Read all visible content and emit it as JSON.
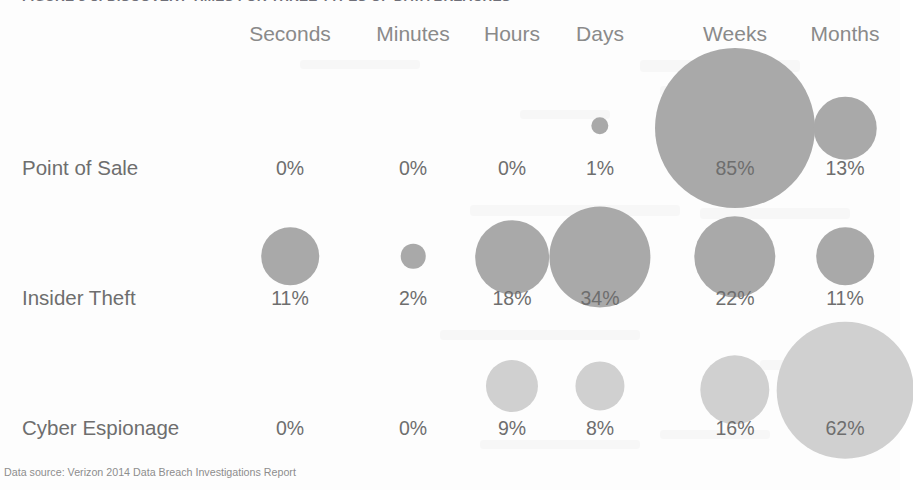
{
  "figure": {
    "title": "FIGURE 3-8: DISCOVERY TIMES FOR THREE TYPES OF DATA BREACHES",
    "footer": "Data source: Verizon 2014 Data Breach Investigations Report"
  },
  "colors": {
    "bubble_dark": "#a9a9a9",
    "bubble_light": "#d0d0d0",
    "text": "#6e6e6e",
    "header_text": "#8a8a8a",
    "title_text": "#6f6f78",
    "background": "#fdfdfd"
  },
  "chart_data": {
    "type": "heatmap",
    "title": "FIGURE 3-8: DISCOVERY TIMES FOR THREE TYPES OF DATA BREACHES",
    "subtitle": "",
    "xlabel": "",
    "ylabel": "",
    "grid": false,
    "legend": "none",
    "value_unit": "percent",
    "encoding": "bubble area proportional to value",
    "categories": [
      "Seconds",
      "Minutes",
      "Hours",
      "Days",
      "Weeks",
      "Months"
    ],
    "rows": [
      "Point of Sale",
      "Insider Theft",
      "Cyber Espionage"
    ],
    "series": [
      {
        "name": "Point of Sale",
        "color": "#a9a9a9",
        "values": [
          0,
          0,
          0,
          1,
          85,
          13
        ],
        "labels": [
          "0%",
          "0%",
          "0%",
          "1%",
          "85%",
          "13%"
        ]
      },
      {
        "name": "Insider Theft",
        "color": "#a9a9a9",
        "values": [
          11,
          2,
          18,
          34,
          22,
          11
        ],
        "labels": [
          "11%",
          "2%",
          "18%",
          "34%",
          "22%",
          "11%"
        ]
      },
      {
        "name": "Cyber Espionage",
        "color": "#d0d0d0",
        "values": [
          0,
          0,
          9,
          8,
          16,
          62
        ],
        "labels": [
          "0%",
          "0%",
          "9%",
          "8%",
          "16%",
          "62%"
        ]
      }
    ],
    "annotations": [
      "Data source: Verizon 2014 Data Breach Investigations Report"
    ]
  },
  "layout": {
    "col_x": [
      290,
      413,
      512,
      600,
      735,
      845
    ],
    "row_label_y": [
      168,
      298,
      428
    ],
    "row_bubble_cy": [
      128,
      257,
      390
    ],
    "header_y": 22
  }
}
